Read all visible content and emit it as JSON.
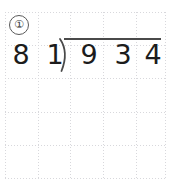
{
  "worksheet": {
    "problem_number": "①",
    "grid": {
      "line_color": "#d8d8dc",
      "vertical_positions": [
        5,
        38,
        70,
        103,
        136,
        165
      ],
      "horizontal_positions": [
        12,
        45,
        78,
        112,
        145,
        178
      ]
    },
    "ink_color": "#1c1c1c",
    "rule_color": "#4a4a4a"
  },
  "division": {
    "divisor": "81",
    "divisor_digits": [
      "8",
      "1"
    ],
    "dividend": "934",
    "dividend_digits": [
      "9",
      "3",
      "4"
    ],
    "operator": "long-division-bracket",
    "expression": "934 ÷ 81",
    "quotient": ""
  }
}
